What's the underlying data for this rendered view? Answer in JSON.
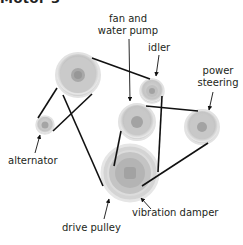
{
  "heading": "Motor 3",
  "colors": {
    "belt": "#111111",
    "pulley_outer": "#cfcfcf",
    "pulley_rim": "#e6e6e6",
    "pulley_mid": "#bdbdbd",
    "pulley_hub": "#9a9a9a",
    "label_text": "#231f20",
    "background": "#ffffff"
  },
  "pulleys": [
    {
      "id": "crank-top",
      "name": "large upper pulley",
      "cx": 78,
      "cy": 75,
      "r": 22
    },
    {
      "id": "alternator",
      "name": "alternator",
      "cx": 45,
      "cy": 125,
      "r": 9
    },
    {
      "id": "idler",
      "name": "idler",
      "cx": 152,
      "cy": 91,
      "r": 12
    },
    {
      "id": "fan-water-pump",
      "name": "fan and water pump",
      "cx": 137,
      "cy": 122,
      "r": 18
    },
    {
      "id": "power-steering",
      "name": "power steering",
      "cx": 202,
      "cy": 127,
      "r": 17
    },
    {
      "id": "drive-pulley",
      "name": "drive pulley",
      "cx": 130,
      "cy": 173,
      "r": 28
    }
  ],
  "labels": {
    "fan_water_pump_line1": "fan and",
    "fan_water_pump_line2": "water pump",
    "idler": "idler",
    "power_steering_line1": "power",
    "power_steering_line2": "steering",
    "alternator": "alternator",
    "drive_pulley": "drive pulley",
    "vibration_damper": "vibration damper"
  }
}
